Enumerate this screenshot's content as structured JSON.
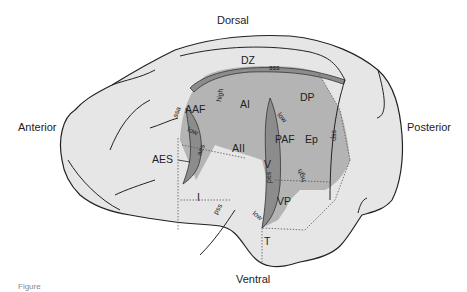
{
  "orientation": {
    "dorsal": "Dorsal",
    "ventral": "Ventral",
    "anterior": "Anterior",
    "posterior": "Posterior"
  },
  "regions": {
    "dz": "DZ",
    "ai": "AI",
    "aaf": "AAF",
    "dp": "DP",
    "paf": "PAF",
    "ep": "Ep",
    "aii": "AII",
    "v": "V",
    "vp": "VP",
    "i": "I",
    "t": "T",
    "aes_region": "AES"
  },
  "sulci": {
    "sss": "sss",
    "ssa": "ssa",
    "ssp": "ssp",
    "aes": "aes",
    "pes": "pes",
    "pss": "pss"
  },
  "gradients": {
    "high_aaf": "high",
    "low_aaf": "low",
    "low_paf": "low",
    "high_paf": "high",
    "low_vp": "low"
  },
  "colors": {
    "brain_fill": "#e6e6e6",
    "auditory_fill": "#b4b4b4",
    "sulcus_fill": "#8c8c8c",
    "outline": "#222222"
  },
  "caption": "Figure"
}
